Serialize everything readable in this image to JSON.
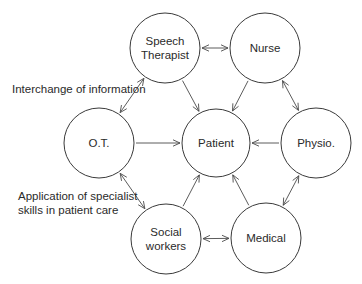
{
  "diagram": {
    "type": "hub-and-ring network",
    "colors": {
      "stroke": "#3a3a3a",
      "text": "#2a2a2a",
      "background": "#ffffff"
    },
    "nodes": [
      {
        "id": "speech",
        "lines": [
          "Speech",
          "Therapist"
        ],
        "cx": 165,
        "cy": 48,
        "r": 35
      },
      {
        "id": "nurse",
        "lines": [
          "Nurse"
        ],
        "cx": 265,
        "cy": 48,
        "r": 35
      },
      {
        "id": "ot",
        "lines": [
          "O.T."
        ],
        "cx": 99,
        "cy": 143,
        "r": 35
      },
      {
        "id": "patient",
        "lines": [
          "Patient"
        ],
        "cx": 216,
        "cy": 143,
        "r": 34
      },
      {
        "id": "physio",
        "lines": [
          "Physio."
        ],
        "cx": 316,
        "cy": 143,
        "r": 35
      },
      {
        "id": "social",
        "lines": [
          "Social",
          "workers"
        ],
        "cx": 166,
        "cy": 239,
        "r": 35
      },
      {
        "id": "medical",
        "lines": [
          "Medical"
        ],
        "cx": 266,
        "cy": 238,
        "r": 35
      }
    ],
    "edges": [
      {
        "from": "speech",
        "to": "nurse",
        "type": "bidirectional"
      },
      {
        "from": "nurse",
        "to": "physio",
        "type": "bidirectional"
      },
      {
        "from": "physio",
        "to": "medical",
        "type": "bidirectional"
      },
      {
        "from": "medical",
        "to": "social",
        "type": "bidirectional"
      },
      {
        "from": "social",
        "to": "ot",
        "type": "bidirectional"
      },
      {
        "from": "ot",
        "to": "speech",
        "type": "bidirectional"
      },
      {
        "from": "speech",
        "to": "patient",
        "type": "directed"
      },
      {
        "from": "nurse",
        "to": "patient",
        "type": "directed"
      },
      {
        "from": "ot",
        "to": "patient",
        "type": "directed"
      },
      {
        "from": "physio",
        "to": "patient",
        "type": "directed"
      },
      {
        "from": "social",
        "to": "patient",
        "type": "directed"
      },
      {
        "from": "medical",
        "to": "patient",
        "type": "directed"
      }
    ],
    "annotations": [
      {
        "id": "interchange",
        "lines": [
          "Interchange of information"
        ],
        "x": 12,
        "y": 93
      },
      {
        "id": "application",
        "lines": [
          "Application of specialist",
          "skills in patient care"
        ],
        "x": 18,
        "y": 200
      }
    ]
  }
}
